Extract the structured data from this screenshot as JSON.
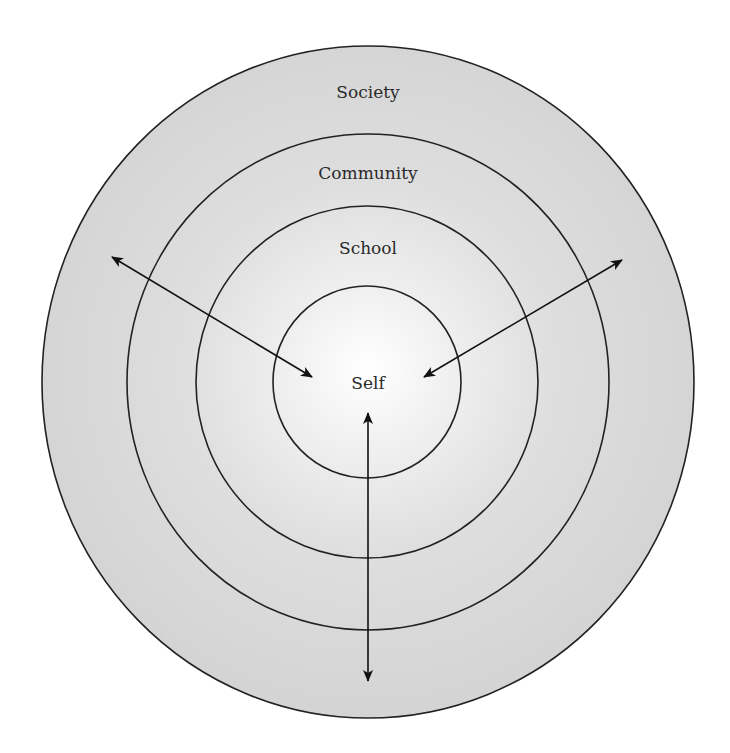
{
  "diagram": {
    "type": "concentric-circles",
    "rings": [
      {
        "label": "Society",
        "cx": 368,
        "cy": 382,
        "rx": 326,
        "ry": 336,
        "label_x": 368,
        "label_y": 98
      },
      {
        "label": "Community",
        "cx": 368,
        "cy": 382,
        "rx": 241,
        "ry": 248,
        "label_x": 368,
        "label_y": 179
      },
      {
        "label": "School",
        "cx": 367,
        "cy": 382,
        "rx": 171,
        "ry": 176,
        "label_x": 368,
        "label_y": 254
      },
      {
        "label": "Self",
        "cx": 367,
        "cy": 382,
        "rx": 94,
        "ry": 96,
        "label_x": 368,
        "label_y": 389
      }
    ],
    "arrows": [
      {
        "name": "upper-left",
        "x1": 112,
        "y1": 257,
        "x2": 312,
        "y2": 377,
        "bidirectional": true
      },
      {
        "name": "upper-right",
        "x1": 622,
        "y1": 260,
        "x2": 424,
        "y2": 377,
        "bidirectional": true
      },
      {
        "name": "bottom",
        "x1": 368,
        "y1": 681,
        "x2": 368,
        "y2": 413,
        "bidirectional": true
      }
    ],
    "colors": {
      "background": "#ffffff",
      "fill_outer": "#d6d6d6",
      "fill_center": "#ffffff",
      "stroke": "#222222",
      "text": "#2a2a2a"
    }
  }
}
